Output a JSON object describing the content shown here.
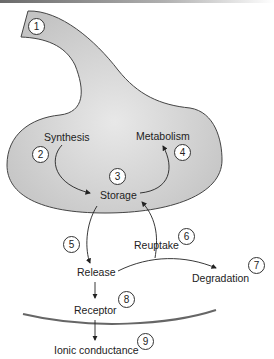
{
  "diagram": {
    "labels": {
      "synthesis": "Synthesis",
      "metabolism": "Metabolism",
      "storage": "Storage",
      "release": "Release",
      "reuptake": "Reuptake",
      "degradation": "Degradation",
      "receptor": "Receptor",
      "ionic_conductance": "Ionic conductance"
    },
    "steps": [
      "1",
      "2",
      "3",
      "4",
      "5",
      "6",
      "7",
      "8",
      "9"
    ],
    "colors": {
      "terminal_fill": "#d4d4d4",
      "outline": "#444444",
      "membrane": "#666666"
    }
  }
}
